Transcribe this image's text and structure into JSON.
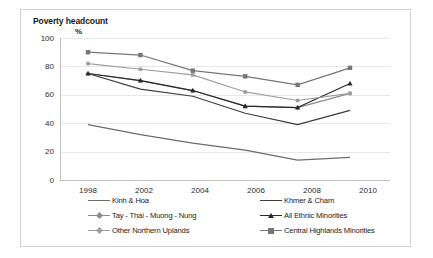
{
  "chart_data": {
    "type": "line",
    "title": "Poverty headcount",
    "subtitle": "%",
    "xlabel": "",
    "ylabel": "",
    "categories": [
      "1998",
      "2002",
      "2004",
      "2006",
      "2008",
      "2010"
    ],
    "ylim": [
      0,
      100
    ],
    "y_ticks": [
      "0",
      "20",
      "40",
      "60",
      "80",
      "100"
    ],
    "grid": true,
    "legend_position": "bottom",
    "series": [
      {
        "name": "Kinh & Hoa",
        "color": "#6b6b6b",
        "marker": "none",
        "values": [
          39,
          32,
          26,
          21,
          14,
          16
        ]
      },
      {
        "name": "Khmer & Cham",
        "color": "#3d3d3d",
        "marker": "none",
        "values": [
          75,
          64,
          59,
          47,
          39,
          49
        ]
      },
      {
        "name": "Tay - Thai - Muong - Nung",
        "color": "#8c8c8c",
        "marker": "diamond",
        "values": [
          75,
          70,
          63,
          52,
          51,
          61
        ]
      },
      {
        "name": "All Ethnic Minorities",
        "color": "#2a2a2a",
        "marker": "triangle",
        "values": [
          75,
          70,
          63,
          52,
          51,
          68
        ]
      },
      {
        "name": "Other Northern Uplands",
        "color": "#9e9e9e",
        "marker": "cross",
        "values": [
          82,
          78,
          74,
          62,
          56,
          61
        ]
      },
      {
        "name": "Central Highlands Minorities",
        "color": "#767676",
        "marker": "square",
        "values": [
          90,
          88,
          77,
          73,
          67,
          79
        ]
      }
    ]
  },
  "axes": {
    "y_ticks": [
      "100",
      "80",
      "60",
      "40",
      "20",
      "0"
    ],
    "x_ticks": [
      "1998",
      "2002",
      "2004",
      "2006",
      "2008",
      "2010"
    ]
  },
  "legend": {
    "column_left": [
      "Kinh & Hoa",
      "Tay - Thai - Muong - Nung",
      "Other Northern Uplands"
    ],
    "column_right": [
      "Khmer & Cham",
      "All Ethnic Minorities",
      "Central Highlands Minorities"
    ]
  }
}
